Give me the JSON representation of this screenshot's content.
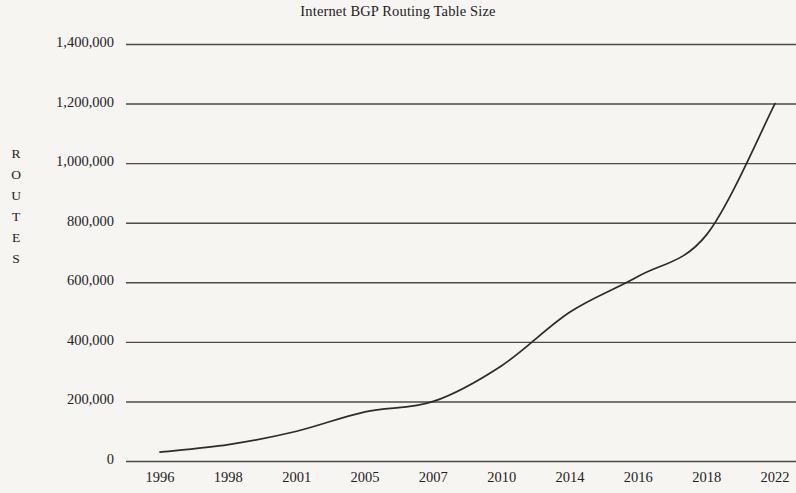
{
  "chart_data": {
    "type": "line",
    "title": "Internet BGP Routing Table Size",
    "xlabel": "",
    "ylabel": "ROUTES",
    "ylabel_letters": [
      "R",
      "O",
      "U",
      "T",
      "E",
      "S"
    ],
    "categories": [
      "1996",
      "1998",
      "2001",
      "2005",
      "2007",
      "2010",
      "2014",
      "2016",
      "2018",
      "2022"
    ],
    "x_tick_labels": [
      "1996",
      "1998",
      "2001",
      "2005",
      "2007",
      "2010",
      "2014",
      "2016",
      "2018",
      "2022"
    ],
    "y_tick_labels": [
      "1,400,000",
      "1,200,000",
      "1,000,000",
      "800,000",
      "600,000",
      "400,000",
      "200,000",
      "0"
    ],
    "y_tick_values": [
      1400000,
      1200000,
      1000000,
      800000,
      600000,
      400000,
      200000,
      0
    ],
    "ylim": [
      0,
      1400000
    ],
    "grid": "horizontal",
    "legend": "none",
    "series": [
      {
        "name": "Routes",
        "values": [
          30000,
          55000,
          100000,
          165000,
          200000,
          320000,
          500000,
          620000,
          760000,
          1200000
        ]
      }
    ],
    "annotations": [],
    "colors": {
      "background": "#f6f5f2",
      "line": "#2b2b2b",
      "grid": "#4a4a4a",
      "text": "#25211f"
    }
  }
}
